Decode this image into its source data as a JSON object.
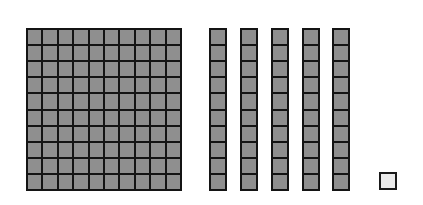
{
  "diagram": {
    "type": "base-ten-blocks",
    "represented_value": 151,
    "hundreds": {
      "count": 1,
      "grid": [
        10,
        10
      ]
    },
    "tens": {
      "count": 5,
      "cells_per_rod": 10,
      "rod_left_px": [
        209,
        240,
        271,
        302,
        332
      ]
    },
    "ones": {
      "count": 1
    },
    "colors": {
      "block_fill": "#8f8f8f",
      "grid_lines": "#141414",
      "unit_fill": "#ebebeb",
      "background": "#ffffff"
    }
  }
}
